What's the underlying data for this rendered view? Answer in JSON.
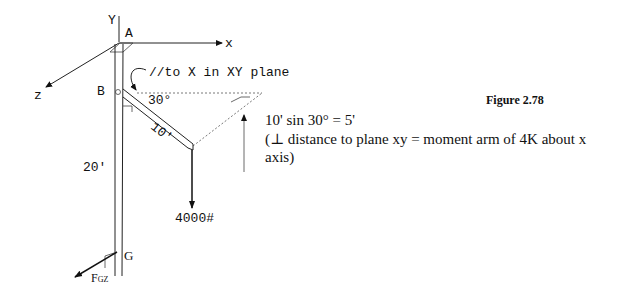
{
  "figure": {
    "caption": "Figure 2.78",
    "labels": {
      "y_axis": "Y",
      "x_axis": "x",
      "z_axis": "z",
      "point_a": "A",
      "point_b": "B",
      "point_g": "G",
      "parallel_note": "//to X in XY plane",
      "angle": "30°",
      "beam_length": "10'",
      "pole_height": "20'",
      "load": "4000#",
      "reaction_main": "F",
      "reaction_sub": "GZ"
    },
    "annotation": {
      "equation": "10' sin 30° = 5'",
      "description": "(⊥ distance to plane xy = moment arm of 4K about x axis)"
    }
  }
}
